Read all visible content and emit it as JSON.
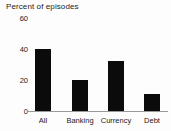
{
  "chart_data": {
    "type": "bar",
    "title": "Percent of episodes",
    "xlabel": "",
    "ylabel": "",
    "ylim": [
      0,
      60
    ],
    "yticks": [
      0,
      20,
      40,
      60
    ],
    "ytick_labels": [
      "0",
      "20",
      "40",
      "60"
    ],
    "grid": false,
    "legend": null,
    "categories": [
      "All",
      "Banking",
      "Currency",
      "Debt"
    ],
    "values": [
      40,
      20,
      32,
      11
    ],
    "series": [
      {
        "name": "Percent of episodes",
        "values": [
          40,
          20,
          32,
          11
        ],
        "color": "#0b0b0b"
      }
    ]
  },
  "colors": {
    "bar": "#0b0b0b",
    "axis": "#9a9a9a",
    "text": "#222222",
    "background": "#fdfdfd"
  }
}
